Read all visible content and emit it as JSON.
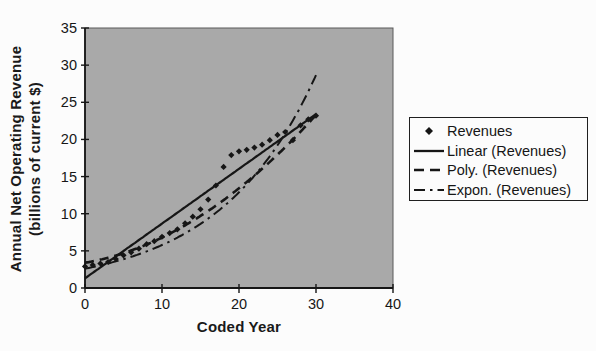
{
  "figure": {
    "kind": "scanned-excel-chart",
    "background_color": "#fcfcfc",
    "plot_area_color": "#a9a9a9",
    "ink_color": "#161616"
  },
  "chart_data": {
    "type": "scatter",
    "title": "",
    "xlabel": "Coded Year",
    "ylabel": "Annual Net Operating Revenue (billions of current $)",
    "ylabel_lines": [
      "Annual Net Operating Revenue",
      "(billions of current $)"
    ],
    "xlim": [
      0,
      40
    ],
    "ylim": [
      0,
      35
    ],
    "x_ticks": [
      0,
      10,
      20,
      30,
      40
    ],
    "y_ticks": [
      0,
      5,
      10,
      15,
      20,
      25,
      30,
      35
    ],
    "grid": false,
    "series": [
      {
        "name": "Revenues",
        "marker": "diamond",
        "x": [
          0,
          1,
          2,
          3,
          4,
          5,
          6,
          7,
          8,
          9,
          10,
          11,
          12,
          13,
          14,
          15,
          16,
          17,
          18,
          19,
          20,
          21,
          22,
          23,
          24,
          25,
          26,
          27,
          28,
          29,
          30
        ],
        "y": [
          2.9,
          3.1,
          3.3,
          3.5,
          3.9,
          4.4,
          4.8,
          5.3,
          5.9,
          6.3,
          6.9,
          7.4,
          7.9,
          8.7,
          9.6,
          10.6,
          11.9,
          13.8,
          16.3,
          17.9,
          18.4,
          18.6,
          18.9,
          19.3,
          19.9,
          20.6,
          21.0,
          19.9,
          21.9,
          22.7,
          23.2
        ]
      }
    ],
    "trendlines": [
      {
        "name": "Linear (Revenues)",
        "model": "linear",
        "style": "solid",
        "coefficients": {
          "intercept": 1.3,
          "slope": 0.737
        },
        "domain": [
          0,
          30
        ]
      },
      {
        "name": "Poly. (Revenues)",
        "model": "quadratic",
        "style": "long-dash",
        "coefficients": {
          "a": 0.0162,
          "b": 0.177,
          "c": 3.4
        },
        "domain": [
          0,
          30
        ]
      },
      {
        "name": "Expon. (Revenues)",
        "model": "exponential",
        "style": "dash-dot",
        "coefficients": {
          "a": 2.6,
          "k": 0.08
        },
        "domain": [
          0,
          30
        ]
      }
    ],
    "legend": {
      "position": "right",
      "items": [
        {
          "label": "Revenues",
          "marker": "diamond"
        },
        {
          "label": "Linear (Revenues)",
          "marker": "solid-line"
        },
        {
          "label": "Poly. (Revenues)",
          "marker": "dashed-line"
        },
        {
          "label": "Expon. (Revenues)",
          "marker": "dash-dot-line"
        }
      ]
    }
  }
}
